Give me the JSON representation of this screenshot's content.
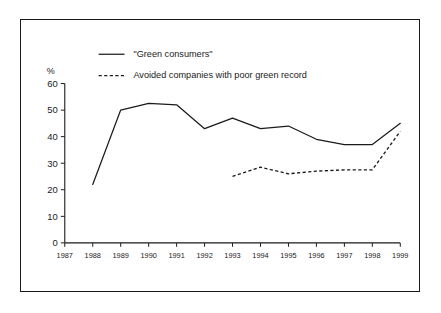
{
  "chart_data": {
    "type": "line",
    "title": "",
    "xlabel": "",
    "ylabel": "%",
    "ylim": [
      0,
      60
    ],
    "yticks": [
      0,
      10,
      20,
      30,
      40,
      50,
      60
    ],
    "grid": false,
    "legend_position": "top-left-inside",
    "x": [
      1987,
      1988,
      1989,
      1990,
      1991,
      1992,
      1993,
      1994,
      1995,
      1996,
      1997,
      1998,
      1999
    ],
    "xticklabels": [
      "1987",
      "1988",
      "1989",
      "1990",
      "1991",
      "1992",
      "1993",
      "1994",
      "1995",
      "1996",
      "1997",
      "1998",
      "1999"
    ],
    "series": [
      {
        "name": "\"Green consumers\"",
        "style": "solid",
        "x": [
          1988,
          1989,
          1990,
          1991,
          1992,
          1993,
          1994,
          1995,
          1996,
          1997,
          1998,
          1999
        ],
        "values": [
          22,
          50,
          52.5,
          52,
          43,
          47,
          43,
          44,
          39,
          37,
          37,
          45
        ]
      },
      {
        "name": "Avoided companies with poor green record",
        "style": "dashed",
        "x": [
          1993,
          1994,
          1995,
          1996,
          1997,
          1998,
          1999
        ],
        "values": [
          25,
          28.5,
          26,
          27,
          27.5,
          27.5,
          42
        ]
      }
    ]
  },
  "legend": {
    "entries": [
      {
        "label": "\"Green consumers\"",
        "style": "solid"
      },
      {
        "label": "Avoided companies with poor green record",
        "style": "dashed"
      }
    ]
  },
  "axes": {
    "unit_label": "%",
    "y_labels": [
      "60",
      "50",
      "40",
      "30",
      "20",
      "10",
      "0"
    ],
    "x_labels": [
      "1987",
      "1988",
      "1989",
      "1990",
      "1991",
      "1992",
      "1993",
      "1994",
      "1995",
      "1996",
      "1997",
      "1998",
      "1999"
    ]
  }
}
